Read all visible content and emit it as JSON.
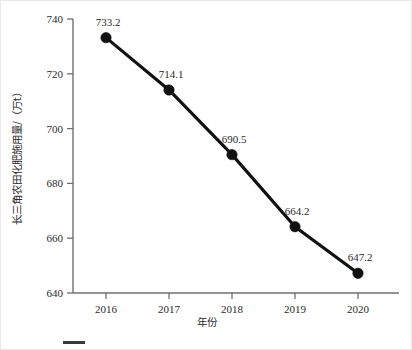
{
  "figure": {
    "background_color": "#ffffff",
    "border_color": "#e9e9e9",
    "caption_fragment": "",
    "caption_rule_color": "#3a3a3a"
  },
  "chart_data": {
    "type": "line",
    "title": "",
    "subtitle": "",
    "xlabel": "年份",
    "ylabel": "长三角农田化肥施用量/（万t）",
    "categories": [
      "2016",
      "2017",
      "2018",
      "2019",
      "2020"
    ],
    "x": [
      2016,
      2017,
      2018,
      2019,
      2020
    ],
    "values": [
      733.2,
      714.1,
      690.5,
      664.2,
      647.2
    ],
    "data_labels": [
      "733.2",
      "714.1",
      "690.5",
      "664.2",
      "647.2"
    ],
    "series": [
      {
        "name": "长三角农田化肥施用量",
        "values": [
          733.2,
          714.1,
          690.5,
          664.2,
          647.2
        ],
        "line_color": "#111111",
        "marker_color": "#111111",
        "marker": "circle"
      }
    ],
    "ylim": [
      640,
      740
    ],
    "yticks": [
      640,
      660,
      680,
      700,
      720,
      740
    ],
    "ytick_labels": [
      "640",
      "660",
      "680",
      "700",
      "720",
      "740"
    ],
    "xtick_labels": [
      "2016",
      "2017",
      "2018",
      "2019",
      "2020"
    ],
    "grid": false,
    "legend": false,
    "legend_position": "none",
    "axis_color": "#6f6f6f",
    "tick_direction": "out"
  }
}
